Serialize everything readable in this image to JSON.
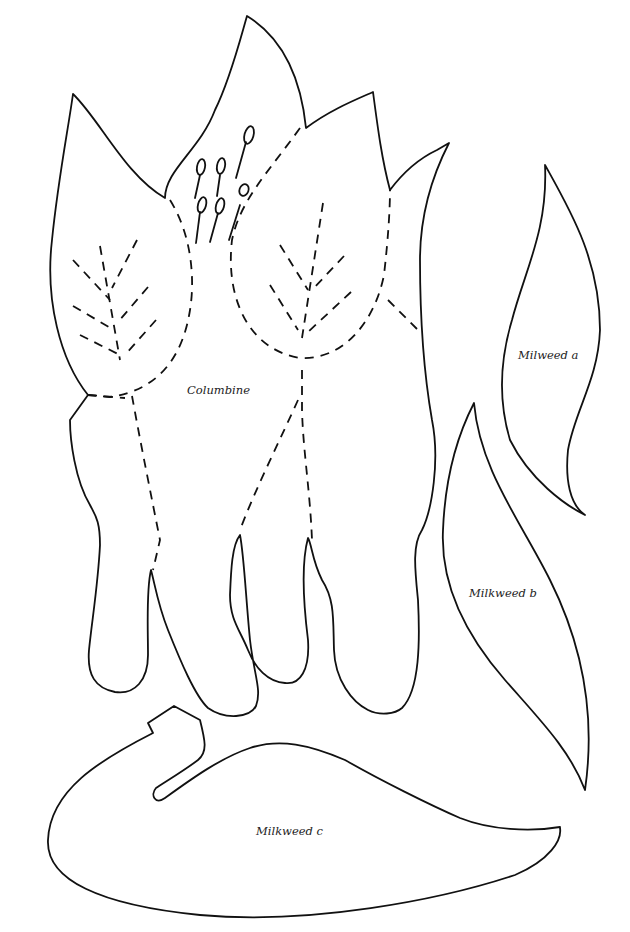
{
  "sheet": {
    "type": "pattern template",
    "background_color": "#ffffff",
    "line_color": "#111111"
  },
  "pieces": [
    {
      "id": "columbine",
      "label": "Columbine",
      "label_pos": [
        187,
        384
      ]
    },
    {
      "id": "milkweed-a",
      "label": "Milweed a",
      "label_pos": [
        519,
        348
      ]
    },
    {
      "id": "milkweed-b",
      "label": "Milkweed b",
      "label_pos": [
        469,
        585
      ]
    },
    {
      "id": "milkweed-c",
      "label": "Milkweed c",
      "label_pos": [
        256,
        825
      ]
    }
  ],
  "legend": {
    "solid_line": "cut line",
    "dashed_line": "fold / stitch line"
  }
}
